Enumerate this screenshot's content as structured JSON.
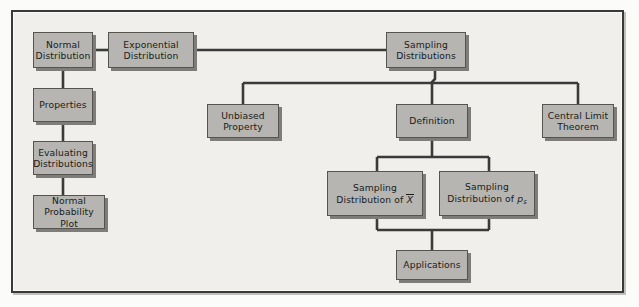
{
  "figure": {
    "type": "flowchart",
    "frame_color": "#3a3a38",
    "background_color": "#f0efec",
    "node_fill": "#b6b5b2",
    "node_border": "#55544f",
    "node_shadow": "#7e7d79",
    "connector_color": "#3a3a38"
  },
  "nodes": {
    "normal_distribution": {
      "line1": "Normal",
      "line2": "Distribution"
    },
    "exponential_distribution": {
      "line1": "Exponential",
      "line2": "Distribution"
    },
    "properties": {
      "line1": "Properties",
      "line2": ""
    },
    "evaluating_distributions": {
      "line1": "Evaluating",
      "line2": "Distributions"
    },
    "normal_probability_plot": {
      "line1": "Normal",
      "line2": "Probability Plot"
    },
    "sampling_distributions": {
      "line1": "Sampling",
      "line2": "Distributions"
    },
    "unbiased_property": {
      "line1": "Unbiased",
      "line2": "Property"
    },
    "definition": {
      "line1": "Definition",
      "line2": ""
    },
    "central_limit_theorem": {
      "line1": "Central Limit",
      "line2": "Theorem"
    },
    "sampling_distribution_xbar": {
      "line1": "Sampling",
      "line2_pre": "Distribution of ",
      "line2_sym": "X",
      "line2_sub": ""
    },
    "sampling_distribution_ps": {
      "line1": "Sampling",
      "line2_pre": "Distribution of ",
      "line2_sym": "p",
      "line2_sub": "s"
    },
    "applications": {
      "line1": "Applications",
      "line2": ""
    }
  },
  "connections": [
    {
      "from": "normal_distribution",
      "to": "exponential_distribution"
    },
    {
      "from": "normal_distribution",
      "to": "properties"
    },
    {
      "from": "properties",
      "to": "evaluating_distributions"
    },
    {
      "from": "evaluating_distributions",
      "to": "normal_probability_plot"
    },
    {
      "from": "exponential_distribution",
      "to": "sampling_distributions"
    },
    {
      "from": "sampling_distributions",
      "to": "unbiased_property"
    },
    {
      "from": "sampling_distributions",
      "to": "definition"
    },
    {
      "from": "sampling_distributions",
      "to": "central_limit_theorem"
    },
    {
      "from": "definition",
      "to": "sampling_distribution_xbar"
    },
    {
      "from": "definition",
      "to": "sampling_distribution_ps"
    },
    {
      "from": "sampling_distribution_xbar",
      "to": "applications"
    },
    {
      "from": "sampling_distribution_ps",
      "to": "applications"
    }
  ]
}
